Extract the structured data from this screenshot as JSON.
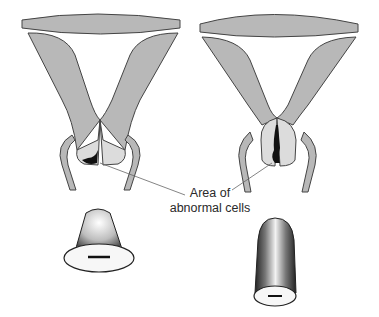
{
  "diagram": {
    "type": "medical-illustration",
    "panels": [
      {
        "id": "left",
        "description": "uterus/cervix cross-section with abnormal cells on ectocervix",
        "specimen": "short wide cone"
      },
      {
        "id": "right",
        "description": "uterus/cervix cross-section with abnormal cells extending up endocervical canal",
        "specimen": "long narrow cone"
      }
    ],
    "annotation": {
      "line1": "Area of",
      "line2": "abnormal cells"
    },
    "colors": {
      "tissue": "#b8b8b8",
      "cervix": "#dcdcdc",
      "outline": "#444444",
      "lesion": "#111111",
      "background": "#ffffff"
    }
  }
}
